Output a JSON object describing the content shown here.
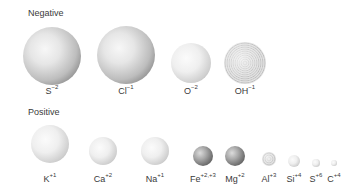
{
  "groups": {
    "negative": {
      "title": "Negative",
      "ions": [
        {
          "symbol": "S",
          "charge": "−2",
          "cx": 52,
          "cy": 56,
          "r": 29,
          "style": "normal"
        },
        {
          "symbol": "Cl",
          "charge": "−1",
          "cx": 126,
          "cy": 55,
          "r": 29,
          "style": "normal"
        },
        {
          "symbol": "O",
          "charge": "−2",
          "cx": 191,
          "cy": 63,
          "r": 20,
          "style": "light"
        },
        {
          "symbol": "OH",
          "charge": "−1",
          "cx": 245,
          "cy": 63,
          "r": 21,
          "style": "dotted"
        }
      ]
    },
    "positive": {
      "title": "Positive",
      "ions": [
        {
          "symbol": "K",
          "charge": "+1",
          "cx": 50,
          "cy": 144,
          "r": 19,
          "style": "light"
        },
        {
          "symbol": "Ca",
          "charge": "+2",
          "cx": 103,
          "cy": 151,
          "r": 14,
          "style": "light"
        },
        {
          "symbol": "Na",
          "charge": "+1",
          "cx": 155,
          "cy": 151,
          "r": 14,
          "style": "light"
        },
        {
          "symbol": "Fe",
          "charge": "+2,+3",
          "cx": 203,
          "cy": 156,
          "r": 10,
          "style": "dark"
        },
        {
          "symbol": "Mg",
          "charge": "+2",
          "cx": 235,
          "cy": 156,
          "r": 10,
          "style": "dark"
        },
        {
          "symbol": "Al",
          "charge": "+3",
          "cx": 269,
          "cy": 159,
          "r": 7,
          "style": "dotted"
        },
        {
          "symbol": "Si",
          "charge": "+4",
          "cx": 294,
          "cy": 161,
          "r": 6,
          "style": "light"
        },
        {
          "symbol": "S",
          "charge": "+6",
          "cx": 316,
          "cy": 163,
          "r": 4,
          "style": "light"
        },
        {
          "symbol": "C",
          "charge": "+4",
          "cx": 334,
          "cy": 163,
          "r": 3,
          "style": "light"
        }
      ]
    }
  },
  "label_positions": {
    "negative_y": 86,
    "positive_y": 174
  }
}
